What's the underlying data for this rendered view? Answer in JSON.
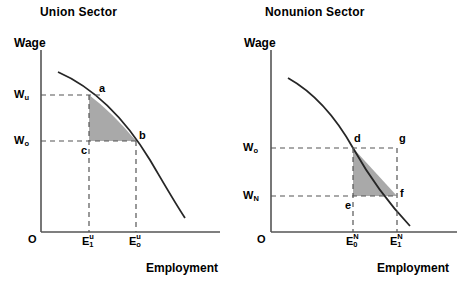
{
  "figure": {
    "type": "economics-diagram",
    "shade_color": "#a9a9a9",
    "line_color": "#262626",
    "dash_color": "#555555"
  },
  "panels": [
    {
      "id": "union",
      "title": "Union Sector",
      "y_axis_label": "Wage",
      "x_axis_label": "Employment",
      "origin_label": "O",
      "y_ticks": [
        {
          "base": "W",
          "sub": "u",
          "sup": "",
          "value_y": 95
        },
        {
          "base": "W",
          "sub": "o",
          "sup": "",
          "value_y": 141
        }
      ],
      "x_ticks": [
        {
          "base": "E",
          "sub": "1",
          "sup": "u",
          "value_x": 89
        },
        {
          "base": "E",
          "sub": "o",
          "sup": "u",
          "value_x": 136
        }
      ],
      "points": [
        {
          "label": "a",
          "x": 100,
          "y": 95
        },
        {
          "label": "b",
          "x": 136,
          "y": 141
        },
        {
          "label": "c",
          "x": 89,
          "y": 141
        }
      ],
      "curve_name": "labor-demand-curve",
      "shaded_region": "triangle a-b-c",
      "shaded_vertices": "a, b, c"
    },
    {
      "id": "nonunion",
      "title": "Nonunion Sector",
      "y_axis_label": "Wage",
      "x_axis_label": "Employment",
      "origin_label": "O",
      "y_ticks": [
        {
          "base": "W",
          "sub": "o",
          "sup": "",
          "value_y": 148
        },
        {
          "base": "W",
          "sub": "N",
          "sup": "",
          "value_y": 196
        }
      ],
      "x_ticks": [
        {
          "base": "E",
          "sub": "0",
          "sup": "N",
          "value_x": 353
        },
        {
          "base": "E",
          "sub": "1",
          "sup": "N",
          "value_x": 397
        }
      ],
      "points": [
        {
          "label": "d",
          "x": 353,
          "y": 148
        },
        {
          "label": "g",
          "x": 397,
          "y": 148
        },
        {
          "label": "e",
          "x": 353,
          "y": 196
        },
        {
          "label": "f",
          "x": 397,
          "y": 196
        }
      ],
      "curve_name": "labor-demand-curve",
      "shaded_region": "triangle d-e-f",
      "shaded_vertices": "d, e, f"
    }
  ]
}
